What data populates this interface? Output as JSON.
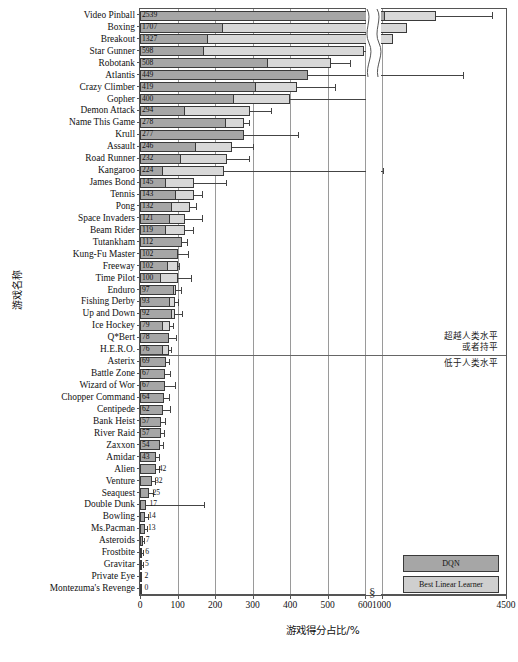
{
  "chart_data": {
    "type": "bar",
    "orientation": "horizontal",
    "title": "",
    "xlabel": "游戏得分占比/%",
    "ylabel": "游戏名称",
    "grid": true,
    "legend_position": "bottom-right",
    "xlim": [
      0,
      4500
    ],
    "axis_break": {
      "from": 600,
      "to": 1000,
      "label": "§"
    },
    "xticks": [
      0,
      100,
      200,
      300,
      400,
      500,
      600,
      1000,
      4500
    ],
    "xtick_labels": [
      "0",
      "100",
      "200",
      "300",
      "400",
      "500",
      "600",
      "1000",
      "4500"
    ],
    "human_level_threshold": 100,
    "annotations": [
      {
        "text": "超越人类水平",
        "position": "above-threshold-line-1"
      },
      {
        "text": "或者持平",
        "position": "above-threshold-line-2"
      },
      {
        "text": "低于人类水平",
        "position": "below-threshold-line"
      }
    ],
    "series": [
      {
        "name": "DQN",
        "color": "#d8d8d8"
      },
      {
        "name": "Best Linear Learner",
        "color": "#a6a6a6"
      }
    ],
    "categories": [
      "Video Pinball",
      "Boxing",
      "Breakout",
      "Star Gunner",
      "Robotank",
      "Atlantis",
      "Crazy Climber",
      "Gopher",
      "Demon Attack",
      "Name This Game",
      "Krull",
      "Assault",
      "Road Runner",
      "Kangaroo",
      "James Bond",
      "Tennis",
      "Pong",
      "Space Invaders",
      "Beam Rider",
      "Tutankham",
      "Kung-Fu Master",
      "Freeway",
      "Time Pilot",
      "Enduro",
      "Fishing Derby",
      "Up and Down",
      "Ice Hockey",
      "Q*Bert",
      "H.E.R.O.",
      "Asterix",
      "Battle Zone",
      "Wizard of Wor",
      "Chopper Command",
      "Centipede",
      "Bank Heist",
      "River Raid",
      "Zaxxon",
      "Amidar",
      "Alien",
      "Venture",
      "Seaquest",
      "Double Dunk",
      "Bowling",
      "Ms.Pacman",
      "Asteroids",
      "Frostbite",
      "Gravitar",
      "Private Eye",
      "Montezuma's Revenge"
    ],
    "values": [
      2539,
      1707,
      1327,
      598,
      508,
      449,
      419,
      400,
      294,
      278,
      277,
      246,
      232,
      224,
      145,
      143,
      132,
      121,
      119,
      112,
      102,
      102,
      100,
      97,
      93,
      92,
      79,
      78,
      76,
      69,
      67,
      67,
      64,
      62,
      57,
      57,
      54,
      43,
      42,
      32,
      25,
      17,
      14,
      13,
      7,
      6,
      5,
      2,
      0
    ],
    "best_linear_values": [
      1100,
      220,
      180,
      170,
      340,
      1050,
      310,
      250,
      120,
      230,
      1000,
      150,
      110,
      60,
      70,
      95,
      85,
      80,
      70,
      170,
      130,
      75,
      55,
      90,
      80,
      85,
      60,
      80,
      60,
      70,
      80,
      100,
      70,
      70,
      75,
      70,
      65,
      50,
      55,
      45,
      30,
      170,
      40,
      35,
      25,
      25,
      25,
      20,
      0
    ],
    "error_upper": [
      4100,
      300,
      210,
      760,
      560,
      3300,
      520,
      700,
      350,
      290,
      420,
      300,
      290,
      1050,
      230,
      165,
      150,
      165,
      140,
      125,
      128,
      105,
      135,
      110,
      100,
      112,
      88,
      95,
      82,
      78,
      80,
      92,
      76,
      80,
      66,
      64,
      62,
      50,
      50,
      40,
      35,
      170,
      20,
      18,
      10,
      9,
      8,
      5,
      0
    ]
  },
  "legend": {
    "items": [
      {
        "label": "DQN",
        "swatch": "#a6a6a6"
      },
      {
        "label": "Best Linear Learner",
        "swatch": "#cfcfcf"
      }
    ]
  },
  "value_labels": [
    "2539",
    "1707",
    "1327",
    "598",
    "508",
    "449",
    "419",
    "400",
    "294",
    "278",
    "277",
    "246",
    "232",
    "224",
    "145",
    "143",
    "132",
    "121",
    "119",
    "112",
    "102",
    "102",
    "100",
    "97",
    "93",
    "92",
    "79",
    "78",
    "76",
    "69",
    "67",
    "67",
    "64",
    "62",
    "57",
    "57",
    "54",
    "43",
    "42",
    "32",
    "25",
    "17",
    "14",
    "13",
    "7",
    "6",
    "5",
    "2",
    "0"
  ]
}
